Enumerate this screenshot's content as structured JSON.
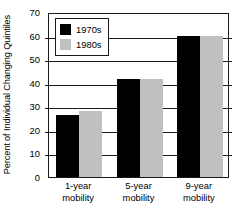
{
  "chart_data": {
    "type": "bar",
    "title": "",
    "xlabel": "",
    "ylabel": "Percent of Individual Changing Quintiles",
    "categories": [
      "1-year mobility",
      "5-year mobility",
      "9-year mobility"
    ],
    "category_lines": [
      [
        "1-year",
        "mobility"
      ],
      [
        "5-year",
        "mobility"
      ],
      [
        "9-year",
        "mobility"
      ]
    ],
    "series": [
      {
        "name": "1970s",
        "color": "#000000",
        "values": [
          26.5,
          41.5,
          60
        ]
      },
      {
        "name": "1980s",
        "color": "#c0c0c0",
        "values": [
          28,
          41.5,
          60
        ]
      }
    ],
    "ylim": [
      0,
      70
    ],
    "yticks": [
      0,
      10,
      20,
      30,
      40,
      50,
      60,
      70
    ],
    "ytick_labels": [
      "0",
      "10",
      "20",
      "30",
      "40",
      "50",
      "60",
      "70"
    ],
    "grid": true,
    "legend_position": "top-left-inside"
  },
  "legend": {
    "entries": [
      {
        "label": "1970s"
      },
      {
        "label": "1980s"
      }
    ]
  }
}
